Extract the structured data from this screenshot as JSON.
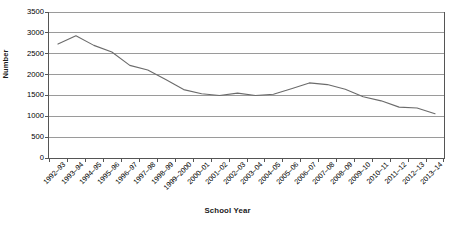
{
  "chart_data": {
    "type": "line",
    "title": "",
    "xlabel": "School Year",
    "ylabel": "Number",
    "ylim": [
      0,
      3500
    ],
    "yticks": [
      0,
      500,
      1000,
      1500,
      2000,
      2500,
      3000,
      3500
    ],
    "grid": true,
    "legend": false,
    "line_color": "#6b6b6b",
    "categories": [
      "1992–93",
      "1993–94",
      "1994–95",
      "1995–96",
      "1996–97",
      "1997–98",
      "1998–99",
      "1999–2000",
      "2000–01",
      "2001–02",
      "2002–03",
      "2003–04",
      "2004–05",
      "2005–06",
      "2006–07",
      "2007–08",
      "2008–09",
      "2009–10",
      "2010–11",
      "2011–12",
      "2012–13",
      "2013–14"
    ],
    "values": [
      2730,
      2930,
      2700,
      2540,
      2220,
      2110,
      1880,
      1640,
      1540,
      1500,
      1555,
      1500,
      1530,
      1660,
      1800,
      1760,
      1650,
      1470,
      1370,
      1220,
      1200,
      1060
    ]
  }
}
